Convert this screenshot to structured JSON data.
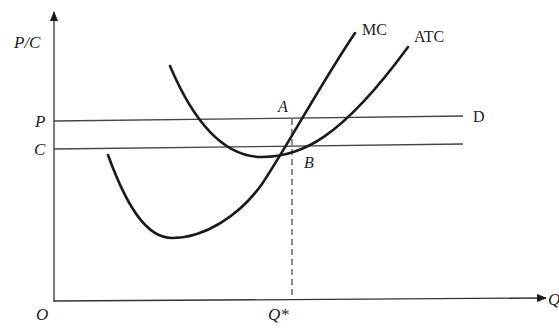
{
  "diagram": {
    "axes": {
      "y_label": "P/C",
      "x_label": "Q",
      "origin_label": "O"
    },
    "price_levels": {
      "p_label": "P",
      "c_label": "C"
    },
    "curves": {
      "mc_label": "MC",
      "atc_label": "ATC",
      "demand_label": "D"
    },
    "points": {
      "a_label": "A",
      "b_label": "B"
    },
    "quantity": {
      "q_star_label": "Q*"
    },
    "colors": {
      "line": "#1a1a1a",
      "thin_line": "#444444",
      "background": "#ffffff"
    }
  }
}
